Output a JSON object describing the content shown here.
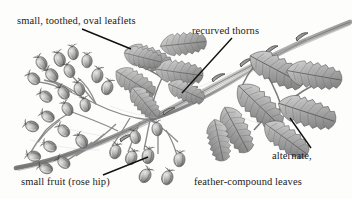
{
  "figure": {
    "kind": "botanical-pencil-illustration",
    "background_color": "#fdfdfc",
    "ink_color": "#1b1b1b",
    "graphite_dark": "#5e5e5e",
    "graphite_mid": "#8a8a8a",
    "graphite_light": "#b6b6b6",
    "graphite_pale": "#d7d7d7"
  },
  "labels": {
    "leaflets": "small, toothed, oval leaflets",
    "thorns": "recurved thorns",
    "fruit": "small fruit (rose hip)",
    "leaves_line1": "alternate,",
    "leaves_line2": "feather-compound leaves"
  },
  "leader_lines": [
    {
      "name": "leader-to-leaflets",
      "x1": 82,
      "y1": 29,
      "x2": 131,
      "y2": 49
    },
    {
      "name": "leader-to-thorns",
      "x1": 232,
      "y1": 38,
      "x2": 182,
      "y2": 93
    },
    {
      "name": "leader-to-fruit",
      "x1": 103,
      "y1": 175,
      "x2": 148,
      "y2": 157
    },
    {
      "name": "leader-to-leaves",
      "x1": 290,
      "y1": 118,
      "x2": 311,
      "y2": 148
    }
  ],
  "parts": {
    "hip_count_visible": 27,
    "leaflet_groups": 3,
    "thorn_count_visible": 6
  }
}
